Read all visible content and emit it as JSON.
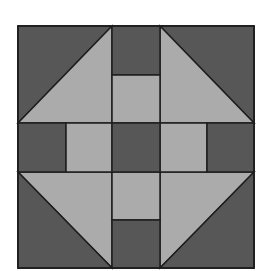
{
  "title": "Quilt block (Churn Dash / Shoo-fly style)",
  "colors": {
    "dark": "#575757",
    "light": "#ababab",
    "outline": "#1e1e1e",
    "background": "#ffffff"
  },
  "block": {
    "grid": "3x3 with split bars",
    "pieces": [
      {
        "name": "top-left-corner",
        "type": "half-square-triangle",
        "light_side": "bottom-right"
      },
      {
        "name": "top-right-corner",
        "type": "half-square-triangle",
        "light_side": "bottom-left"
      },
      {
        "name": "bottom-left-corner",
        "type": "half-square-triangle",
        "light_side": "top-right"
      },
      {
        "name": "bottom-right-corner",
        "type": "half-square-triangle",
        "light_side": "top-left"
      },
      {
        "name": "top-bar",
        "type": "split-rectangle",
        "outer": "dark",
        "inner": "light"
      },
      {
        "name": "bottom-bar",
        "type": "split-rectangle",
        "outer": "dark",
        "inner": "light"
      },
      {
        "name": "left-bar",
        "type": "split-rectangle",
        "outer": "dark",
        "inner": "light"
      },
      {
        "name": "right-bar",
        "type": "split-rectangle",
        "outer": "dark",
        "inner": "light"
      },
      {
        "name": "center-square",
        "type": "square",
        "color": "dark"
      }
    ]
  }
}
